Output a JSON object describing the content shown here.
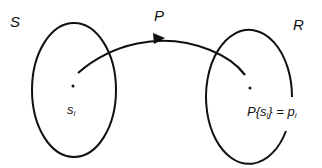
{
  "diagram": {
    "sets": [
      {
        "name": "S",
        "label": "S",
        "element_label": "s",
        "element_sub": "i"
      },
      {
        "name": "R",
        "label": "R",
        "element_label_prefix": "P{s",
        "element_sub": "i",
        "element_label_mid": "} = p",
        "element_sub2": "i"
      }
    ],
    "mapping": {
      "label": "P",
      "from": "S",
      "to": "R"
    },
    "colors": {
      "stroke": "#111111",
      "background": "#ffffff"
    }
  }
}
